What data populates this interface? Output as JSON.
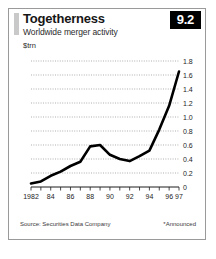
{
  "card": {
    "title": "Togetherness",
    "subtitle": "Worldwide merger activity",
    "unit": "$trn",
    "badge": "9.2",
    "source": "Source: Securities Data Company",
    "footnote": "*Announced"
  },
  "chart_data": {
    "type": "line",
    "title": "Togetherness",
    "subtitle": "Worldwide merger activity",
    "xlabel": "",
    "ylabel": "$trn",
    "ylim": [
      0,
      1.8
    ],
    "xlim": [
      1982,
      1997
    ],
    "grid": true,
    "legend": false,
    "yticks": [
      "0",
      "0.2",
      "0.4",
      "0.6",
      "0.8",
      "1.0",
      "1.2",
      "1.4",
      "1.6",
      "1.8"
    ],
    "ytick_values": [
      0,
      0.2,
      0.4,
      0.6,
      0.8,
      1.0,
      1.2,
      1.4,
      1.6,
      1.8
    ],
    "xticks": [
      "1982",
      "84",
      "86",
      "88",
      "90",
      "92",
      "94",
      "96",
      "97"
    ],
    "xtick_values": [
      1982,
      1984,
      1986,
      1988,
      1990,
      1992,
      1994,
      1996,
      1997
    ],
    "x": [
      1982,
      1983,
      1984,
      1985,
      1986,
      1987,
      1988,
      1989,
      1990,
      1991,
      1992,
      1993,
      1994,
      1995,
      1996,
      1997
    ],
    "values": [
      0.05,
      0.08,
      0.16,
      0.22,
      0.3,
      0.36,
      0.58,
      0.6,
      0.46,
      0.4,
      0.37,
      0.44,
      0.52,
      0.82,
      1.16,
      1.65
    ],
    "series": [
      {
        "name": "Worldwide merger activity",
        "color": "#000000",
        "values": [
          0.05,
          0.08,
          0.16,
          0.22,
          0.3,
          0.36,
          0.58,
          0.6,
          0.46,
          0.4,
          0.37,
          0.44,
          0.52,
          0.82,
          1.16,
          1.65
        ]
      }
    ],
    "annotations": [
      "*Announced"
    ],
    "source": "Source: Securities Data Company"
  }
}
